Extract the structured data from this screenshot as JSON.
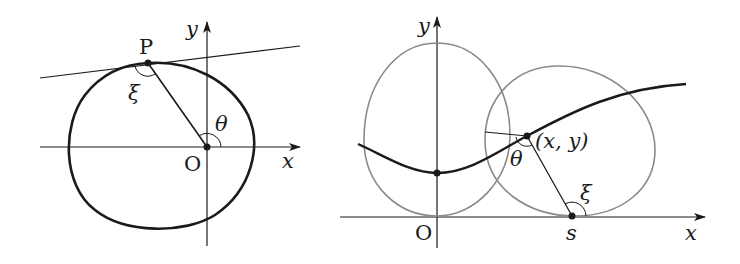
{
  "figures": [
    {
      "id": "ellipse-figure",
      "labels": {
        "point_p": "P",
        "origin": "O",
        "x_axis": "x",
        "y_axis": "y",
        "angle_theta": "θ",
        "angle_xi": "ξ"
      },
      "elements": [
        "coordinate axes",
        "closed oval curve",
        "tangent line at P",
        "segment OP",
        "angle θ at O",
        "angle ξ at P"
      ]
    },
    {
      "id": "rolling-curve-figure",
      "labels": {
        "point_xy": "(x, y)",
        "origin": "O",
        "contact_point": "s",
        "x_axis": "x",
        "y_axis": "y",
        "angle_theta": "θ",
        "angle_xi": "ξ"
      },
      "elements": [
        "coordinate axes",
        "oval at initial position",
        "oval rolled to contact point s",
        "traced curve",
        "segment from (x, y) to s",
        "angle θ at (x, y)",
        "angle ξ at s"
      ]
    }
  ],
  "colors": {
    "ink": "#1a1a1a",
    "grey_curve": "#8a8a8a",
    "background": "#ffffff"
  }
}
